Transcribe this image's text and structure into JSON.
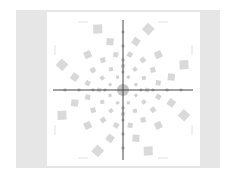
{
  "figure": {
    "frame_color": "#e6e6e6",
    "canvas_color": "#ffffff",
    "center": [
      76,
      78
    ],
    "crosshair": {
      "color": "#444444",
      "vertical": {
        "x": 76,
        "y1": 8,
        "y2": 148
      },
      "horizontal": {
        "y": 78,
        "x1": 6,
        "x2": 146
      }
    },
    "center_disc": {
      "r": 6,
      "color": "#b5b5b5"
    },
    "rings": [
      {
        "radius": 14,
        "count": 8,
        "size": 3,
        "color": "#d0d0d0",
        "offset": 22.5
      },
      {
        "radius": 24,
        "count": 12,
        "size": 4,
        "color": "#d4d4d4",
        "offset": 0
      },
      {
        "radius": 36,
        "count": 16,
        "size": 5,
        "color": "#d6d6d6",
        "offset": 11
      },
      {
        "radius": 50,
        "count": 12,
        "size": 7,
        "color": "#d8d8d8",
        "offset": 15
      },
      {
        "radius": 66,
        "count": 8,
        "size": 9,
        "color": "#dadada",
        "offset": 22.5
      }
    ],
    "axis_markers": {
      "color": "#c4c4c4",
      "radii": [
        18,
        30,
        44,
        58
      ],
      "size": 3
    }
  }
}
